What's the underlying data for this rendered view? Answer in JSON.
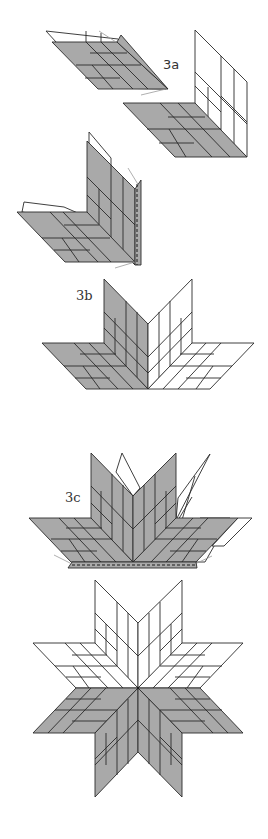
{
  "labels": {
    "step_3a": "3a",
    "step_3b": "3b",
    "step_3c": "3c"
  },
  "colors": {
    "fabric_dark": "#a9a9a9",
    "fabric_light": "#ffffff",
    "seam": "#2a2a2a",
    "pin": "#9a9a9a"
  },
  "figures": [
    {
      "id": "step-3a-left-piece",
      "description": "Tilted diamond unit with flap folded back"
    },
    {
      "id": "step-3a-right-piece",
      "description": "L-shaped unit: white wall, gray floor"
    },
    {
      "id": "step-3a-sewn-pair",
      "description": "Two units pinned together along vertical seam"
    },
    {
      "id": "step-3b",
      "description": "Half-star V with two floor diamonds"
    },
    {
      "id": "step-3c",
      "description": "Half star with remaining diamonds pinned and seam along base"
    },
    {
      "id": "finished-star",
      "description": "Completed eight-point Lone Star: top half light, bottom half dark"
    }
  ]
}
